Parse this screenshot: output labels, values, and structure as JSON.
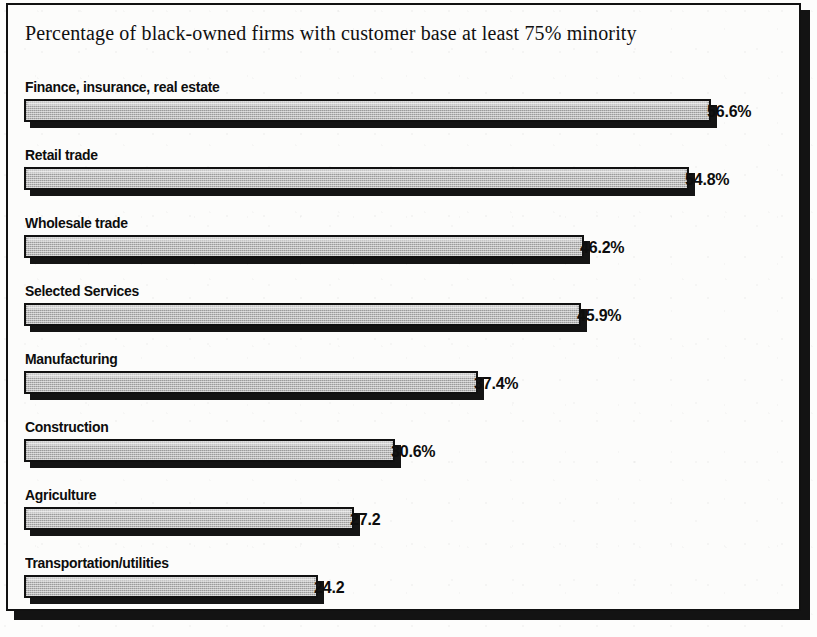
{
  "chart_data": {
    "type": "bar",
    "orientation": "horizontal",
    "title": "Percentage of black-owned firms with customer base at least 75% minority",
    "xlabel": "",
    "ylabel": "",
    "xlim": [
      0,
      60
    ],
    "grid": false,
    "legend": null,
    "categories": [
      "Finance, insurance, real estate",
      "Retail trade",
      "Wholesale trade",
      "Selected Services",
      "Manufacturing",
      "Construction",
      "Agriculture",
      "Transportation/utilities"
    ],
    "values": [
      56.6,
      54.8,
      46.2,
      45.9,
      37.4,
      30.6,
      27.2,
      24.2
    ],
    "value_labels": [
      "56.6%",
      "54.8%",
      "46.2%",
      "45.9%",
      "37.4%",
      "30.6%",
      "27.2",
      "24.2"
    ],
    "bars": [
      {
        "label": "Finance, insurance, real estate",
        "value": 56.6,
        "value_label": "56.6%"
      },
      {
        "label": "Retail trade",
        "value": 54.8,
        "value_label": "54.8%"
      },
      {
        "label": "Wholesale trade",
        "value": 46.2,
        "value_label": "46.2%"
      },
      {
        "label": "Selected Services",
        "value": 45.9,
        "value_label": "45.9%"
      },
      {
        "label": "Manufacturing",
        "value": 37.4,
        "value_label": "37.4%"
      },
      {
        "label": "Construction",
        "value": 30.6,
        "value_label": "30.6%"
      },
      {
        "label": "Agriculture",
        "value": 27.2,
        "value_label": "27.2"
      },
      {
        "label": "Transportation/utilities",
        "value": 24.2,
        "value_label": "24.2"
      }
    ],
    "colors": {
      "bar_fill": "#b9b9b9",
      "bar_outline": "#111111",
      "bar_shadow": "#141414",
      "background": "#fcfcfb",
      "text": "#0d0d0d",
      "frame": "#111111"
    }
  },
  "render": {
    "bar_origin_px": 22,
    "px_per_unit": 12.13
  }
}
